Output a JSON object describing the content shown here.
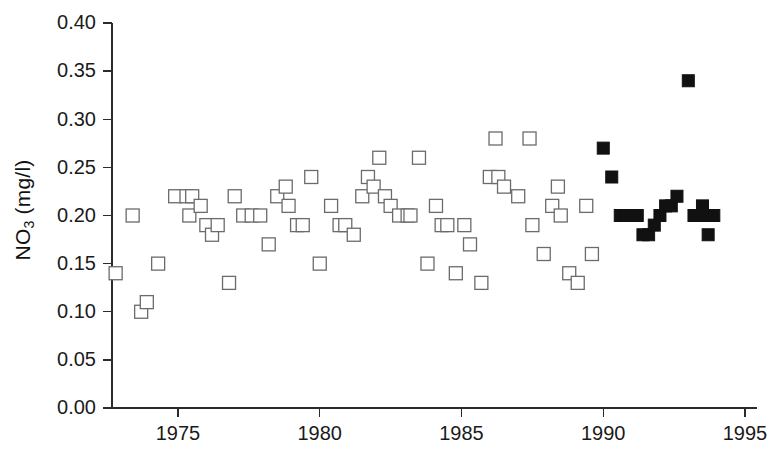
{
  "chart_data": {
    "type": "scatter",
    "title": "",
    "xlabel": "",
    "ylabel": "NO3 (mg/l)",
    "ylabel_base": "NO",
    "ylabel_sub": "3",
    "ylabel_units": " (mg/l)",
    "xlim": [
      1972.6,
      1995.5
    ],
    "ylim": [
      0.0,
      0.4
    ],
    "grid": false,
    "legend": "none",
    "xticks": [
      1975,
      1980,
      1985,
      1990,
      1995
    ],
    "xtick_labels": [
      "1975",
      "1980",
      "1985",
      "1990",
      "1995"
    ],
    "yticks": [
      0.0,
      0.05,
      0.1,
      0.15,
      0.2,
      0.25,
      0.3,
      0.35,
      0.4
    ],
    "ytick_labels": [
      "0.00",
      "0.05",
      "0.10",
      "0.15",
      "0.20",
      "0.25",
      "0.30",
      "0.35",
      "0.40"
    ],
    "series": [
      {
        "name": "open-squares",
        "marker": "square-open",
        "marker_fill": "#ffffff",
        "marker_stroke": "#6b6b6b",
        "points": [
          [
            1972.8,
            0.14
          ],
          [
            1973.4,
            0.2
          ],
          [
            1973.7,
            0.1
          ],
          [
            1973.9,
            0.11
          ],
          [
            1974.3,
            0.15
          ],
          [
            1974.9,
            0.22
          ],
          [
            1975.3,
            0.22
          ],
          [
            1975.5,
            0.22
          ],
          [
            1975.4,
            0.2
          ],
          [
            1975.8,
            0.21
          ],
          [
            1976.0,
            0.19
          ],
          [
            1976.2,
            0.18
          ],
          [
            1976.4,
            0.19
          ],
          [
            1976.8,
            0.13
          ],
          [
            1977.0,
            0.22
          ],
          [
            1977.3,
            0.2
          ],
          [
            1977.6,
            0.2
          ],
          [
            1977.9,
            0.2
          ],
          [
            1978.2,
            0.17
          ],
          [
            1978.5,
            0.22
          ],
          [
            1978.8,
            0.23
          ],
          [
            1978.9,
            0.21
          ],
          [
            1979.2,
            0.19
          ],
          [
            1979.4,
            0.19
          ],
          [
            1979.7,
            0.24
          ],
          [
            1980.0,
            0.15
          ],
          [
            1980.4,
            0.21
          ],
          [
            1980.7,
            0.19
          ],
          [
            1980.9,
            0.19
          ],
          [
            1981.2,
            0.18
          ],
          [
            1981.5,
            0.22
          ],
          [
            1981.7,
            0.24
          ],
          [
            1981.9,
            0.23
          ],
          [
            1982.1,
            0.26
          ],
          [
            1982.3,
            0.22
          ],
          [
            1982.5,
            0.21
          ],
          [
            1982.8,
            0.2
          ],
          [
            1983.1,
            0.2
          ],
          [
            1983.2,
            0.2
          ],
          [
            1983.5,
            0.26
          ],
          [
            1983.8,
            0.15
          ],
          [
            1984.1,
            0.21
          ],
          [
            1984.3,
            0.19
          ],
          [
            1984.5,
            0.19
          ],
          [
            1984.8,
            0.14
          ],
          [
            1985.1,
            0.19
          ],
          [
            1985.3,
            0.17
          ],
          [
            1985.7,
            0.13
          ],
          [
            1986.0,
            0.24
          ],
          [
            1986.2,
            0.28
          ],
          [
            1986.3,
            0.24
          ],
          [
            1986.5,
            0.23
          ],
          [
            1987.0,
            0.22
          ],
          [
            1987.4,
            0.28
          ],
          [
            1987.5,
            0.19
          ],
          [
            1987.9,
            0.16
          ],
          [
            1988.2,
            0.21
          ],
          [
            1988.4,
            0.23
          ],
          [
            1988.5,
            0.2
          ],
          [
            1988.8,
            0.14
          ],
          [
            1989.1,
            0.13
          ],
          [
            1989.4,
            0.21
          ],
          [
            1989.6,
            0.16
          ]
        ]
      },
      {
        "name": "filled-squares",
        "marker": "square-filled",
        "marker_fill": "#111111",
        "marker_stroke": "#111111",
        "points": [
          [
            1990.0,
            0.27
          ],
          [
            1990.3,
            0.24
          ],
          [
            1990.6,
            0.2
          ],
          [
            1990.8,
            0.2
          ],
          [
            1991.0,
            0.2
          ],
          [
            1991.2,
            0.2
          ],
          [
            1991.4,
            0.18
          ],
          [
            1991.6,
            0.18
          ],
          [
            1991.8,
            0.19
          ],
          [
            1992.0,
            0.2
          ],
          [
            1992.2,
            0.21
          ],
          [
            1992.4,
            0.21
          ],
          [
            1992.6,
            0.22
          ],
          [
            1993.0,
            0.34
          ],
          [
            1993.2,
            0.2
          ],
          [
            1993.5,
            0.21
          ],
          [
            1993.6,
            0.2
          ],
          [
            1993.7,
            0.18
          ],
          [
            1993.9,
            0.2
          ]
        ]
      }
    ]
  },
  "axes": {
    "y_axis_name": "nitrate-concentration-axis",
    "x_axis_name": "year-axis"
  }
}
